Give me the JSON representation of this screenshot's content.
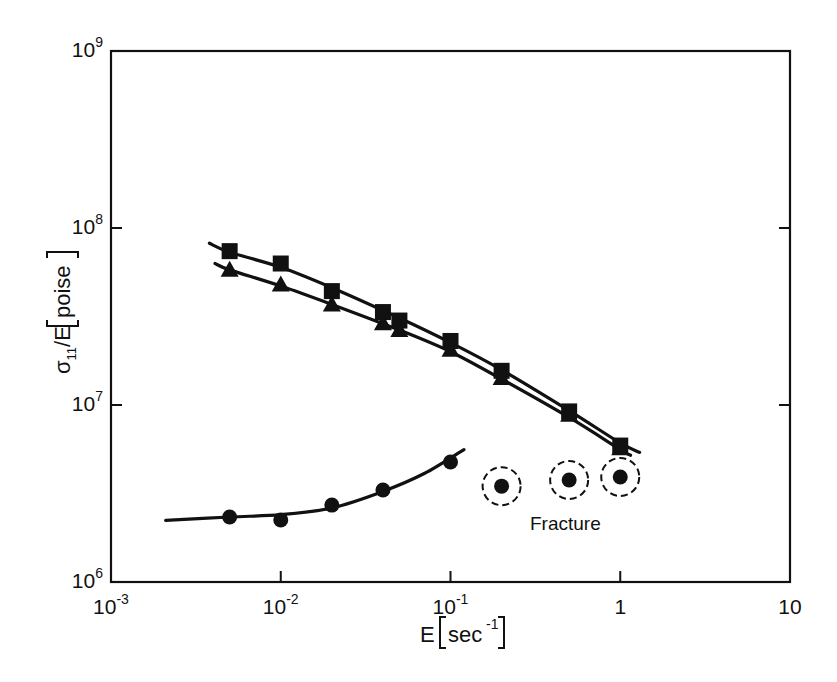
{
  "chart_data": {
    "type": "scatter",
    "title": "",
    "xlabel": "E [sec⁻¹]",
    "ylabel": "σ11/E [poise]",
    "xscale": "log",
    "yscale": "log",
    "xlim": [
      0.001,
      10
    ],
    "ylim": [
      1000000,
      1000000000
    ],
    "grid": false,
    "legend": null,
    "x_ticks": [
      {
        "value": 0.001,
        "base": "10",
        "exp": "-3"
      },
      {
        "value": 0.01,
        "base": "10",
        "exp": "-2"
      },
      {
        "value": 0.1,
        "base": "10",
        "exp": "-1"
      },
      {
        "value": 1,
        "base": "1",
        "exp": ""
      },
      {
        "value": 10,
        "base": "10",
        "exp": ""
      }
    ],
    "y_ticks": [
      {
        "value": 1000000,
        "base": "10",
        "exp": "6"
      },
      {
        "value": 10000000,
        "base": "10",
        "exp": "7"
      },
      {
        "value": 100000000,
        "base": "10",
        "exp": "8"
      },
      {
        "value": 1000000000,
        "base": "10",
        "exp": "9"
      }
    ],
    "series": [
      {
        "name": "squares",
        "marker": "square",
        "x": [
          0.005,
          0.01,
          0.02,
          0.04,
          0.05,
          0.1,
          0.2,
          0.5,
          1.0
        ],
        "y": [
          74000000,
          63000000,
          44000000,
          33500000,
          30000000,
          23000000,
          15600000,
          9200000,
          5900000
        ],
        "fit_line": {
          "x": [
            0.0038,
            0.005,
            0.01,
            0.02,
            0.05,
            0.1,
            0.2,
            0.5,
            1.0,
            1.3
          ],
          "y": [
            82000000,
            73000000,
            60000000,
            46000000,
            31000000,
            22500000,
            15800000,
            9300000,
            6100000,
            5400000
          ]
        }
      },
      {
        "name": "triangles",
        "marker": "triangle",
        "x": [
          0.005,
          0.01,
          0.02,
          0.04,
          0.05,
          0.1,
          0.2,
          0.5,
          1.0
        ],
        "y": [
          58000000,
          48000000,
          37000000,
          29000000,
          26500000,
          20500000,
          14200000,
          8800000,
          5700000
        ],
        "fit_line": {
          "x": [
            0.0041,
            0.005,
            0.01,
            0.02,
            0.05,
            0.1,
            0.2,
            0.5,
            1.0,
            1.15
          ],
          "y": [
            63000000,
            58000000,
            47000000,
            37000000,
            26500000,
            20000000,
            14000000,
            8500000,
            5600000,
            5200000
          ]
        }
      },
      {
        "name": "circles",
        "marker": "circle",
        "x": [
          0.005,
          0.01,
          0.02,
          0.04,
          0.1
        ],
        "y": [
          2330000,
          2240000,
          2720000,
          3310000,
          4760000
        ],
        "fit_line": {
          "x": [
            0.0021,
            0.005,
            0.01,
            0.02,
            0.04,
            0.07,
            0.12
          ],
          "y": [
            2230000,
            2330000,
            2400000,
            2620000,
            3250000,
            4100000,
            5600000
          ]
        }
      },
      {
        "name": "fracture",
        "marker": "circle-dashed-ring",
        "x": [
          0.2,
          0.5,
          1.0
        ],
        "y": [
          3480000,
          3770000,
          3920000
        ]
      }
    ],
    "annotations": [
      {
        "text": "Fracture",
        "x": 0.45,
        "y": 2450000
      }
    ]
  },
  "labels": {
    "xlabel_main": "E",
    "xlabel_unit": "sec",
    "xlabel_exp": "-1",
    "ylabel_sigma": "σ",
    "ylabel_sub": "11",
    "ylabel_rest": "/E",
    "ylabel_unit": "poise",
    "fracture": "Fracture"
  },
  "style": {
    "ink": "#111111",
    "background": "#ffffff"
  }
}
